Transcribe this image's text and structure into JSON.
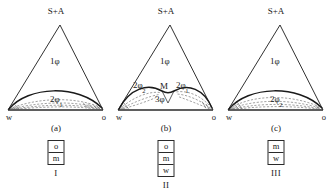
{
  "figure": {
    "panel_count": 3
  },
  "panels": [
    {
      "id": "a",
      "caption": "(a)",
      "apex_label": "S+A",
      "left_vertex": "w",
      "right_vertex": "o",
      "regions": [
        {
          "name": "one-phase",
          "label": "1φ",
          "x": 50,
          "y": 60
        },
        {
          "name": "two-phase-1",
          "label": "2φ",
          "sub": "1",
          "x": 56,
          "y": 101
        }
      ],
      "legend": {
        "cells": [
          "o",
          "m"
        ],
        "numeral": "I"
      }
    },
    {
      "id": "b",
      "caption": "(b)",
      "apex_label": "S+A",
      "left_vertex": "w",
      "right_vertex": "o",
      "regions": [
        {
          "name": "one-phase",
          "label": "1φ",
          "x": 50,
          "y": 60
        },
        {
          "name": "two-phase-2",
          "label": "2φ",
          "sub": "2",
          "x": 29,
          "y": 88
        },
        {
          "name": "middle-point",
          "label": "M",
          "x": 54,
          "y": 90
        },
        {
          "name": "two-phase-1",
          "label": "2φ",
          "sub": "1",
          "x": 72,
          "y": 88
        },
        {
          "name": "three-phase",
          "label": "3φ",
          "x": 52,
          "y": 100
        }
      ],
      "legend": {
        "cells": [
          "o",
          "m",
          "w"
        ],
        "numeral": "II"
      }
    },
    {
      "id": "c",
      "caption": "(c)",
      "apex_label": "S+A",
      "left_vertex": "w",
      "right_vertex": "o",
      "regions": [
        {
          "name": "one-phase",
          "label": "1φ",
          "x": 50,
          "y": 60
        },
        {
          "name": "two-phase-2",
          "label": "2φ",
          "sub": "2",
          "x": 56,
          "y": 101
        }
      ],
      "legend": {
        "cells": [
          "m",
          "w"
        ],
        "numeral": "III"
      }
    }
  ],
  "colors": {
    "line": "#1a1a1a",
    "tie_line": "#6b6b6b",
    "background": "#ffffff"
  }
}
